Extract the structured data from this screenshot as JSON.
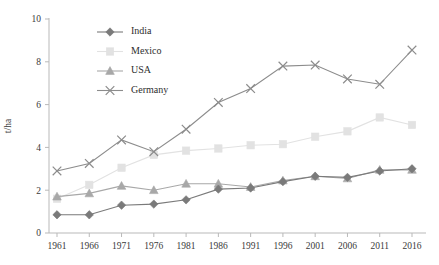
{
  "chart_data": {
    "type": "line",
    "title": "",
    "xlabel": "",
    "ylabel": "t/ha",
    "categories": [
      "1961",
      "1966",
      "1971",
      "1976",
      "1981",
      "1986",
      "1991",
      "1996",
      "2001",
      "2006",
      "2011",
      "2016"
    ],
    "ylim": [
      0,
      10
    ],
    "yticks": [
      "0",
      "2",
      "4",
      "6",
      "8",
      "10"
    ],
    "grid": false,
    "legend_position": "top-center",
    "series": [
      {
        "name": "India",
        "marker": "diamond",
        "color": "#7a7a7a",
        "values": [
          0.85,
          0.85,
          1.3,
          1.35,
          1.55,
          2.05,
          2.1,
          2.4,
          2.65,
          2.6,
          2.9,
          3.0
        ]
      },
      {
        "name": "Mexico",
        "marker": "square",
        "color": "#e2e2e2",
        "values": [
          1.6,
          2.25,
          3.05,
          3.65,
          3.85,
          3.95,
          4.1,
          4.15,
          4.5,
          4.75,
          5.4,
          5.05
        ]
      },
      {
        "name": "USA",
        "marker": "triangle",
        "color": "#a8a8a8",
        "values": [
          1.7,
          1.85,
          2.2,
          2.0,
          2.3,
          2.3,
          2.15,
          2.45,
          2.65,
          2.55,
          2.95,
          2.95
        ]
      },
      {
        "name": "Germany",
        "marker": "cross",
        "color": "#8c8c8c",
        "values": [
          2.9,
          3.25,
          4.35,
          3.8,
          4.85,
          6.1,
          6.75,
          7.8,
          7.85,
          7.2,
          6.95,
          8.55
        ]
      }
    ]
  },
  "legend": {
    "items": [
      {
        "label": "India"
      },
      {
        "label": "Mexico"
      },
      {
        "label": "USA"
      },
      {
        "label": "Germany"
      }
    ]
  },
  "axes": {
    "y_title": "t/ha"
  },
  "colors": {
    "axis": "#b9b9b9",
    "text": "#3a3a3a",
    "background": "#ffffff"
  }
}
